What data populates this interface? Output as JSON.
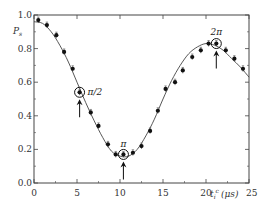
{
  "chart_data": {
    "type": "scatter",
    "title": "",
    "xlabel": "t_i^c (μs)",
    "ylabel": "P_s",
    "xlim": [
      0,
      25
    ],
    "ylim": [
      0.0,
      1.0
    ],
    "x_ticks": [
      0,
      5,
      10,
      15,
      20,
      25
    ],
    "x_tick_labels": [
      "0",
      "5",
      "10",
      "15",
      "20",
      "25"
    ],
    "y_ticks": [
      0.0,
      0.2,
      0.4,
      0.6,
      0.8,
      1.0
    ],
    "y_tick_labels": [
      "0.0",
      "0.2",
      "0.4",
      "0.6",
      "0.8",
      "1.0"
    ],
    "grid": false,
    "legend": null,
    "series": [
      {
        "name": "measured",
        "style": "filled-circle-with-errorbars",
        "x": [
          0.5,
          1.5,
          2.6,
          3.5,
          4.5,
          5.3,
          6.6,
          7.5,
          8.6,
          9.5,
          10.4,
          11.5,
          12.5,
          13.5,
          14.4,
          15.3,
          16.4,
          17.3,
          18.4,
          19.4,
          20.3,
          21.2,
          22.3,
          23.3,
          24.3
        ],
        "y": [
          0.97,
          0.94,
          0.88,
          0.78,
          0.68,
          0.54,
          0.42,
          0.34,
          0.23,
          0.17,
          0.17,
          0.18,
          0.22,
          0.31,
          0.43,
          0.56,
          0.6,
          0.67,
          0.75,
          0.79,
          0.83,
          0.83,
          0.79,
          0.74,
          0.68
        ]
      },
      {
        "name": "fit",
        "style": "solid-line",
        "x": [
          0,
          1,
          2,
          3,
          4,
          5,
          6,
          7,
          8,
          9,
          10,
          11,
          12,
          13,
          14,
          15,
          16,
          17,
          18,
          19,
          20,
          21,
          22,
          23,
          24,
          25
        ],
        "y": [
          0.96,
          0.95,
          0.9,
          0.82,
          0.72,
          0.6,
          0.48,
          0.37,
          0.27,
          0.19,
          0.16,
          0.16,
          0.2,
          0.28,
          0.38,
          0.5,
          0.61,
          0.7,
          0.77,
          0.81,
          0.83,
          0.82,
          0.79,
          0.74,
          0.69,
          0.63
        ]
      }
    ],
    "annotations": [
      {
        "label": "π/2",
        "x": 5.3,
        "y": 0.54,
        "marker": "circle+arrow-up"
      },
      {
        "label": "π",
        "x": 10.4,
        "y": 0.17,
        "marker": "circle+arrow-up"
      },
      {
        "label": "2π",
        "x": 21.2,
        "y": 0.83,
        "marker": "circle+arrow-up"
      }
    ]
  },
  "labels": {
    "ylabel": "P",
    "ylabel_sub": "s",
    "xlabel_t": "t",
    "xlabel_sub": "i",
    "xlabel_sup": "c",
    "xlabel_unit": "(μs)",
    "anno_pi_half": "π/2",
    "anno_pi": "π",
    "anno_two_pi": "2π"
  }
}
